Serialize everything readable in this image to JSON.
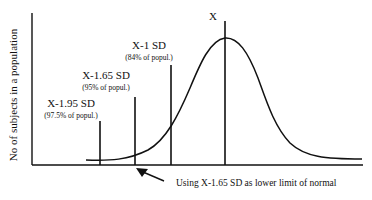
{
  "diagram": {
    "y_axis_label": "No of subjects in a population",
    "mean_label": "X",
    "markers": [
      {
        "label": "X-1 SD",
        "sublabel": "(84% of popul.)"
      },
      {
        "label": "X-1.65 SD",
        "sublabel": "(95% of popul.)"
      },
      {
        "label": "X-1.95 SD",
        "sublabel": "(97.5% of popul.)"
      }
    ],
    "annotation": "Using X-1.65 SD as lower limit of normal",
    "colors": {
      "ink": "#111111",
      "background": "#ffffff"
    }
  }
}
